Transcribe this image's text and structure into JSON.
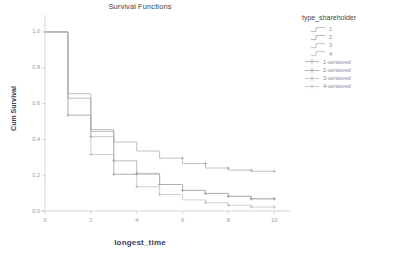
{
  "chart_data": {
    "type": "line",
    "title": "Survival Functions",
    "xlabel": "longest_time",
    "ylabel": "Cum Survival",
    "xlim": [
      0,
      10.6
    ],
    "ylim": [
      0.0,
      1.05
    ],
    "xticks": [
      "0",
      "2",
      "4",
      "6",
      "8",
      "10"
    ],
    "xtick_values": [
      0,
      2,
      4,
      6,
      8,
      10
    ],
    "yticks": [
      "1.0",
      "0.8",
      "0.6",
      "0.4",
      "0.2",
      "0.0"
    ],
    "ytick_values": [
      1.0,
      0.8,
      0.6,
      0.4,
      0.2,
      0.0
    ],
    "grid": false,
    "legend_position": "right",
    "legend_title": "type_shareholder",
    "series": [
      {
        "name": "1",
        "color": "#9aa0a6",
        "step_x": [
          0,
          1,
          1,
          2,
          2,
          3,
          3,
          4,
          4,
          5,
          5,
          6,
          6,
          7,
          7,
          8,
          8,
          9,
          9,
          10
        ],
        "step_y": [
          1.0,
          1.0,
          0.655,
          0.655,
          0.455,
          0.455,
          0.385,
          0.385,
          0.335,
          0.335,
          0.295,
          0.295,
          0.265,
          0.265,
          0.24,
          0.24,
          0.228,
          0.228,
          0.222,
          0.222
        ],
        "censored_x": [
          6,
          7,
          8,
          9,
          10
        ],
        "censored_y": [
          0.295,
          0.265,
          0.24,
          0.228,
          0.222
        ]
      },
      {
        "name": "2",
        "color": "#8f949a",
        "step_x": [
          0,
          1,
          1,
          2,
          2,
          3,
          3,
          4,
          4,
          5,
          5,
          6,
          6,
          7,
          7,
          8,
          8,
          9,
          9,
          10
        ],
        "step_y": [
          1.0,
          1.0,
          0.63,
          0.63,
          0.445,
          0.445,
          0.28,
          0.28,
          0.21,
          0.21,
          0.148,
          0.148,
          0.115,
          0.115,
          0.098,
          0.098,
          0.082,
          0.082,
          0.068,
          0.068
        ],
        "censored_x": [
          2,
          3,
          4,
          5,
          6,
          7,
          8,
          9,
          10
        ],
        "censored_y": [
          0.415,
          0.28,
          0.21,
          0.148,
          0.115,
          0.098,
          0.082,
          0.068,
          0.068
        ]
      },
      {
        "name": "3",
        "color": "#a6abb0",
        "step_x": [
          0,
          1,
          1,
          2,
          2,
          3,
          3,
          4,
          4,
          5,
          5,
          6,
          6,
          7,
          7,
          8,
          8,
          9,
          9,
          10
        ],
        "step_y": [
          1.0,
          1.0,
          0.535,
          0.535,
          0.415,
          0.415,
          0.205,
          0.205,
          0.205,
          0.205,
          0.148,
          0.148,
          0.115,
          0.115,
          0.098,
          0.098,
          0.082,
          0.082,
          0.068,
          0.068
        ],
        "censored_x": [
          1,
          3,
          4,
          6,
          7,
          8,
          9,
          10
        ],
        "censored_y": [
          0.535,
          0.205,
          0.205,
          0.115,
          0.098,
          0.082,
          0.068,
          0.068
        ]
      },
      {
        "name": "4",
        "color": "#b0b5ba",
        "step_x": [
          0,
          1,
          1,
          2,
          2,
          3,
          3,
          4,
          4,
          5,
          5,
          6,
          6,
          7,
          7,
          8,
          8,
          9,
          9,
          10
        ],
        "step_y": [
          1.0,
          1.0,
          0.535,
          0.535,
          0.315,
          0.315,
          0.205,
          0.205,
          0.135,
          0.135,
          0.092,
          0.092,
          0.062,
          0.062,
          0.046,
          0.046,
          0.032,
          0.032,
          0.022,
          0.022
        ],
        "censored_x": [
          2,
          4,
          5,
          7,
          8,
          9,
          10
        ],
        "censored_y": [
          0.315,
          0.135,
          0.092,
          0.046,
          0.032,
          0.022,
          0.022
        ]
      }
    ],
    "legend_entries": [
      {
        "label": "1",
        "kind": "line"
      },
      {
        "label": "2",
        "kind": "line"
      },
      {
        "label": "3",
        "kind": "line"
      },
      {
        "label": "4",
        "kind": "line"
      },
      {
        "label": "1-censored",
        "kind": "censored"
      },
      {
        "label": "2-censored",
        "kind": "censored"
      },
      {
        "label": "3-censored",
        "kind": "censored"
      },
      {
        "label": "4-censored",
        "kind": "censored"
      }
    ]
  }
}
